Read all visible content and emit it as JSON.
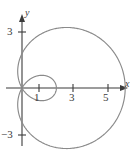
{
  "figure": {
    "kind": "polar-limacon-plot",
    "background_color": "#ffffff",
    "curve_color": "#8a8a8a",
    "axis_color": "#3b3b3b",
    "text_color": "#3b3b3b"
  },
  "axes": {
    "x_axis_label": "x",
    "y_axis_label": "y",
    "x_ticks": [
      {
        "value": 1,
        "label": "1"
      },
      {
        "value": 3,
        "label": "3"
      },
      {
        "value": 5,
        "label": "5"
      }
    ],
    "y_ticks": [
      {
        "value": 3,
        "label": "3"
      },
      {
        "value": -3,
        "label": "−3"
      }
    ],
    "origin_px": {
      "x": 22,
      "y": 88
    },
    "units_per_px": 17.2,
    "x_range": [
      -1.3,
      6.5
    ],
    "y_range": [
      -3.7,
      3.6
    ],
    "grid": false
  },
  "chart_data": {
    "type": "line",
    "title": "",
    "xlabel": "x",
    "ylabel": "y",
    "xlim": [
      -1.3,
      6.5
    ],
    "ylim": [
      -3.7,
      3.6
    ],
    "grid": false,
    "legend": null,
    "annotations": [],
    "series": [
      {
        "name": "limacon-outer-loop",
        "description": "Outer loop of limacon r = 2 + 4 cos(theta), theta from -2pi/3 to 2pi/3",
        "polar": {
          "a": 2,
          "b": 4,
          "form": "r = a + b*cos(theta)"
        },
        "x_intercepts": [
          6,
          0
        ],
        "max_x": 6,
        "y_extent": [
          -3.6,
          3.6
        ]
      },
      {
        "name": "limacon-inner-loop",
        "description": "Inner loop of limacon r = 2 + 4 cos(theta), theta from 2pi/3 to 4pi/3",
        "polar": {
          "a": 2,
          "b": 4,
          "form": "r = a + b*cos(theta)"
        },
        "x_intercepts": [
          0,
          2.7
        ],
        "max_x": 2.7,
        "y_extent": [
          -1.3,
          1.3
        ]
      }
    ],
    "categories": [],
    "values": []
  }
}
